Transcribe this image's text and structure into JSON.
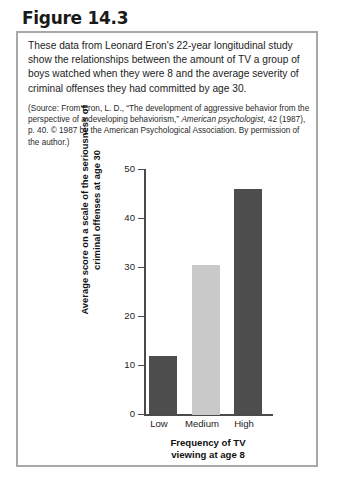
{
  "figure": {
    "title": "Figure 14.3",
    "body": "These data from Leonard Eron's 22-year longitudinal study show the relationships between the amount of TV a group of boys watched when they were 8 and the average severity of criminal offenses they had committed by age 30.",
    "source_prefix": "(Source: From Eron, L. D., “The development of aggressive behavior from the perspective of a developing behaviorism,” ",
    "source_italic": "American psychologist",
    "source_suffix": ", 42 (1987), p. 40. © 1987 by the American Psychological Association. By permission of the author.)"
  },
  "chart_data": {
    "type": "bar",
    "title": "",
    "categories": [
      "Low",
      "Medium",
      "High"
    ],
    "values": [
      12,
      30.5,
      46
    ],
    "bar_colors": [
      "#4d4d4d",
      "#c9c9c9",
      "#4d4d4d"
    ],
    "xlabel": "Frequency of TV\nviewing at age 8",
    "ylabel": "Average score on a scale of the seriousness of\ncriminal offenses at age 30",
    "ylim": [
      0,
      50
    ],
    "yticks": [
      0,
      10,
      20,
      30,
      40,
      50
    ],
    "ytick_labels": [
      "0",
      "10",
      "20",
      "30",
      "40",
      "50"
    ],
    "grid": false,
    "legend": false
  }
}
